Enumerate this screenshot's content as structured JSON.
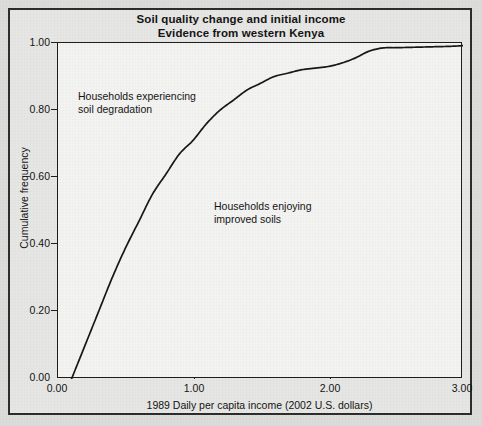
{
  "figure": {
    "title_line1": "Soil quality change and initial income",
    "title_line2": "Evidence from western Kenya"
  },
  "chart_data": {
    "type": "line",
    "title": "Soil quality change and initial income\nEvidence from western Kenya",
    "xlabel": "1989 Daily per capita income (2002 U.S. dollars)",
    "ylabel": "Cumulative frequency",
    "xlim": [
      0.0,
      3.0
    ],
    "ylim": [
      0.0,
      1.0
    ],
    "grid": false,
    "legend": null,
    "xticks": [
      "0.00",
      "1.00",
      "2.00",
      "3.00"
    ],
    "xtick_values": [
      0.0,
      1.0,
      2.0,
      3.0
    ],
    "yticks": [
      "0.00",
      "0.20",
      "0.40",
      "0.60",
      "0.80",
      "1.00"
    ],
    "ytick_values": [
      0.0,
      0.2,
      0.4,
      0.6,
      0.8,
      1.0
    ],
    "series": [
      {
        "name": "Cumulative distribution of 1989 daily per capita income",
        "x": [
          0.1,
          0.2,
          0.3,
          0.4,
          0.5,
          0.6,
          0.7,
          0.8,
          0.9,
          1.0,
          1.1,
          1.2,
          1.3,
          1.4,
          1.5,
          1.6,
          1.7,
          1.8,
          1.9,
          2.0,
          2.1,
          2.2,
          2.3,
          2.4,
          2.5,
          2.6,
          2.7,
          2.8,
          2.9,
          3.0
        ],
        "y": [
          0.0,
          0.1,
          0.2,
          0.3,
          0.39,
          0.47,
          0.55,
          0.61,
          0.67,
          0.71,
          0.76,
          0.8,
          0.83,
          0.86,
          0.88,
          0.9,
          0.91,
          0.92,
          0.925,
          0.93,
          0.94,
          0.955,
          0.975,
          0.985,
          0.986,
          0.987,
          0.988,
          0.989,
          0.99,
          0.992
        ]
      }
    ],
    "annotations": [
      {
        "id": "upper",
        "text": "Households experiencing\nsoil degradation",
        "x": 0.16,
        "y": 0.855
      },
      {
        "id": "lower",
        "text": "Households enjoying\nimproved soils",
        "x": 1.16,
        "y": 0.525
      }
    ]
  }
}
